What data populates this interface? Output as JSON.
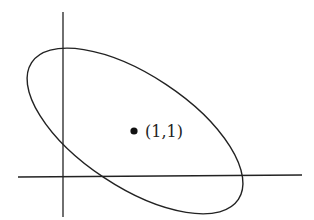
{
  "diagram": {
    "title": "",
    "center_label": "(1,1)",
    "center": {
      "x": 1,
      "y": 1
    },
    "elements": [
      "x-axis",
      "y-axis",
      "rotated-ellipse",
      "center-point"
    ],
    "colors": {
      "stroke": "#222222",
      "background": "#ffffff"
    }
  }
}
